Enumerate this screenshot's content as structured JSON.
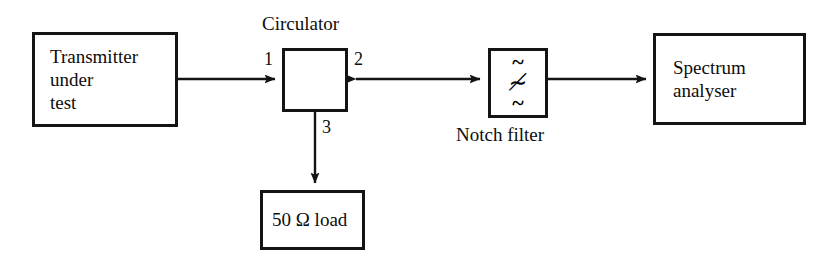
{
  "diagram": {
    "canvas": {
      "width": 837,
      "height": 272,
      "background": "#ffffff"
    },
    "ink_color": "#141414"
  },
  "blocks": {
    "transmitter": {
      "label": "Transmitter\nunder\ntest",
      "x": 32,
      "y": 32,
      "w": 146,
      "h": 95
    },
    "circulator": {
      "caption": "Circulator",
      "x": 282,
      "y": 48,
      "w": 66,
      "h": 64,
      "rotation_direction": "counter-clockwise",
      "ports": [
        {
          "name": "1",
          "side": "left"
        },
        {
          "name": "2",
          "side": "right"
        },
        {
          "name": "3",
          "side": "bottom"
        }
      ]
    },
    "notch_filter": {
      "caption": "Notch filter",
      "x": 488,
      "y": 48,
      "w": 60,
      "h": 70,
      "glyphs": [
        "~",
        "≁",
        "~"
      ]
    },
    "spectrum_analyser": {
      "label": "Spectrum\nanalyser",
      "x": 653,
      "y": 33,
      "w": 153,
      "h": 92
    },
    "load": {
      "label": "50 Ω load",
      "x": 260,
      "y": 190,
      "w": 105,
      "h": 60
    }
  },
  "connections": [
    {
      "name": "transmitter-to-circulator-port1",
      "from": "transmitter",
      "to": "circulator",
      "arrowheads": "end",
      "orientation": "horizontal"
    },
    {
      "name": "circulator-port2-to-notch-filter",
      "from": "circulator",
      "to": "notch_filter",
      "arrowheads": "both",
      "orientation": "horizontal"
    },
    {
      "name": "notch-filter-to-spectrum-analyser",
      "from": "notch_filter",
      "to": "spectrum_analyser",
      "arrowheads": "end",
      "orientation": "horizontal"
    },
    {
      "name": "circulator-port3-to-load",
      "from": "circulator",
      "to": "load",
      "arrowheads": "end",
      "orientation": "vertical"
    }
  ]
}
